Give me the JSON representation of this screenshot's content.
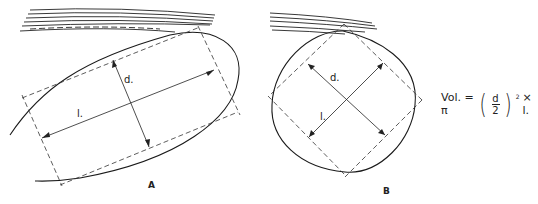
{
  "figures": [
    {
      "id": "A",
      "caption": "A",
      "labels": {
        "length": "l.",
        "diameter": "d."
      },
      "shape": "elongated ellipse"
    },
    {
      "id": "B",
      "caption": "B",
      "labels": {
        "length": "l.",
        "diameter": "d."
      },
      "shape": "round ellipse"
    }
  ],
  "formula": {
    "prefix": "Vol. = π",
    "numerator": "d",
    "denominator": "2",
    "exponent": "2",
    "suffix": "× l."
  }
}
